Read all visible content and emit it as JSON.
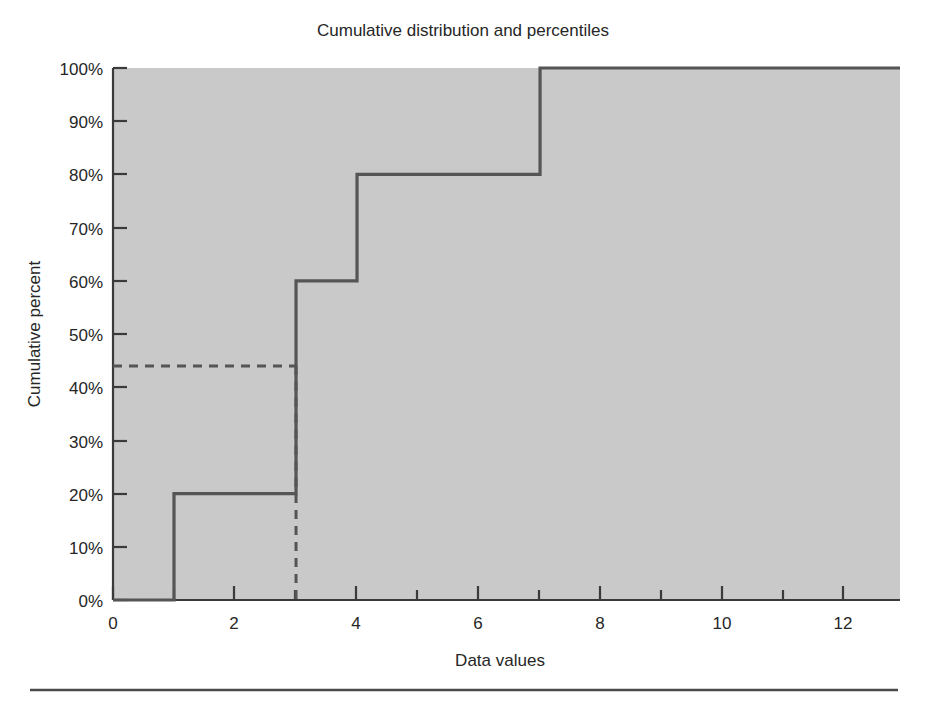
{
  "chart_data": {
    "type": "line",
    "subtype": "step-cumulative-distribution",
    "title": "Cumulative distribution and percentiles",
    "xlabel": "Data values",
    "ylabel": "Cumulative percent",
    "xlim": [
      0,
      12.9
    ],
    "ylim": [
      0,
      100
    ],
    "grid": false,
    "legend": null,
    "xticks_major": [
      0,
      2,
      4,
      6,
      8,
      10,
      12
    ],
    "xticklabels": [
      "0",
      "2",
      "4",
      "6",
      "8",
      "10",
      "12"
    ],
    "xticks_minor": [
      1,
      3,
      5,
      7,
      9,
      11
    ],
    "yticks": [
      0,
      10,
      20,
      30,
      40,
      50,
      60,
      70,
      80,
      90,
      100
    ],
    "yticklabels": [
      "0%",
      "10%",
      "20%",
      "30%",
      "40%",
      "50%",
      "60%",
      "70%",
      "80%",
      "90%",
      "100%"
    ],
    "series": [
      {
        "name": "Cumulative distribution",
        "style": "step-post",
        "color": "#555555",
        "points": [
          {
            "x": 0,
            "y": 0
          },
          {
            "x": 1,
            "y": 0
          },
          {
            "x": 1,
            "y": 20
          },
          {
            "x": 3,
            "y": 20
          },
          {
            "x": 3,
            "y": 60
          },
          {
            "x": 4,
            "y": 60
          },
          {
            "x": 4,
            "y": 80
          },
          {
            "x": 7,
            "y": 80
          },
          {
            "x": 7,
            "y": 100
          },
          {
            "x": 12.9,
            "y": 100
          }
        ]
      }
    ],
    "annotations": [
      {
        "name": "percentile-guide",
        "style": "dashed",
        "color": "#555555",
        "description": "Dashed guide marking the percentile of data value 3",
        "percentile_value": 44,
        "data_value": 3,
        "segments": [
          {
            "from": {
              "x": 0,
              "y": 44
            },
            "to": {
              "x": 3,
              "y": 44
            }
          },
          {
            "from": {
              "x": 3,
              "y": 44
            },
            "to": {
              "x": 3,
              "y": 0
            }
          }
        ]
      }
    ],
    "plot_background_color": "#c9c9c9",
    "step_values": [
      {
        "x": 1,
        "cumulative_percent": 20
      },
      {
        "x": 3,
        "cumulative_percent": 60
      },
      {
        "x": 4,
        "cumulative_percent": 80
      },
      {
        "x": 7,
        "cumulative_percent": 100
      }
    ]
  },
  "figure": {
    "footer_rule": true
  }
}
